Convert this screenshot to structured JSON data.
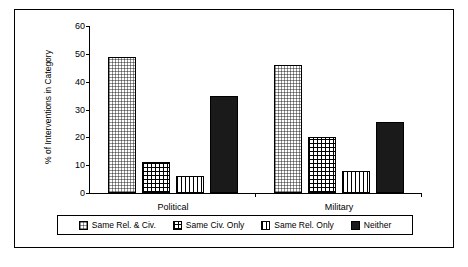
{
  "chart_data": {
    "type": "bar",
    "title": "",
    "xlabel": "",
    "ylabel": "% of Interventions in Category",
    "ylim": [
      0,
      60
    ],
    "yticks": [
      0,
      10,
      20,
      30,
      40,
      50,
      60
    ],
    "grid": false,
    "legend_position": "bottom",
    "categories": [
      "Political",
      "Military"
    ],
    "series": [
      {
        "name": "Same Rel. & Civ.",
        "values": [
          49,
          46
        ],
        "fill": "light-dots"
      },
      {
        "name": "Same Civ. Only",
        "values": [
          11,
          20
        ],
        "fill": "grid-hatch"
      },
      {
        "name": "Same Rel. Only",
        "values": [
          6,
          8
        ],
        "fill": "vertical-lines"
      },
      {
        "name": "Neither",
        "values": [
          35,
          25.5
        ],
        "fill": "solid-black"
      }
    ]
  },
  "legend": {
    "items": [
      {
        "label": "Same Rel. & Civ."
      },
      {
        "label": "Same Civ. Only"
      },
      {
        "label": "Same Rel. Only"
      },
      {
        "label": "Neither"
      }
    ]
  }
}
